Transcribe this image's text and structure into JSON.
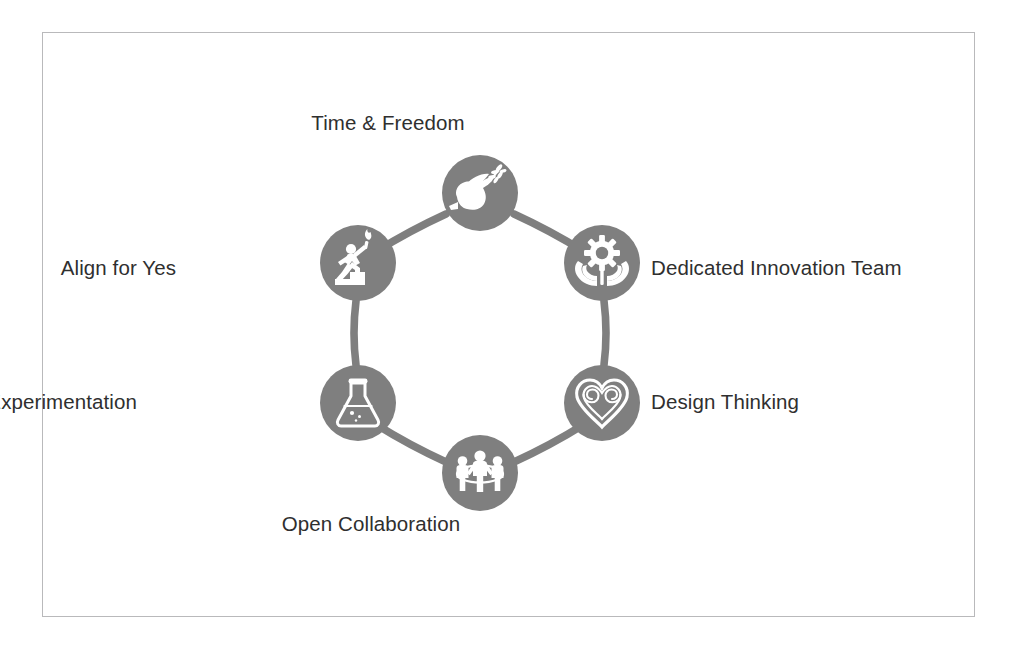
{
  "diagram": {
    "type": "cycle",
    "shape": "hexagonal-ring",
    "colors": {
      "node_fill": "#7f7f7f",
      "ring_stroke": "#7f7f7f",
      "icon_fill": "#ffffff",
      "label_text": "#2f2f2f",
      "frame_border": "#b9b9bb",
      "background": "#ffffff"
    },
    "nodes": [
      {
        "id": "time-freedom",
        "label": "Time & Freedom",
        "icon": "dove-olive-branch-icon",
        "position": "top"
      },
      {
        "id": "dedicated-innovation-team",
        "label": "Dedicated Innovation Team",
        "icon": "gear-in-hands-icon",
        "position": "upper-right"
      },
      {
        "id": "design-thinking",
        "label": "Design Thinking",
        "icon": "heart-spirals-icon",
        "position": "lower-right"
      },
      {
        "id": "open-collaboration",
        "label": "Open Collaboration",
        "icon": "three-people-holding-hands-icon",
        "position": "bottom"
      },
      {
        "id": "experimentation",
        "label": "Experimentation",
        "icon": "erlenmeyer-flask-icon",
        "position": "lower-left"
      },
      {
        "id": "align-for-yes",
        "label": "Align for Yes",
        "icon": "climber-with-torch-icon",
        "position": "upper-left"
      }
    ]
  }
}
